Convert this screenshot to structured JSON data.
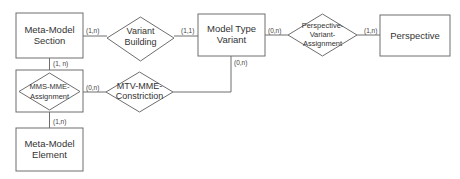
{
  "diagram": {
    "type": "entity-relationship",
    "colors": {
      "stroke": "#6e6e6e",
      "text": "#333333",
      "background": "#ffffff"
    },
    "entities": [
      {
        "id": "mms",
        "label_lines": [
          "Meta-Model",
          "Section"
        ]
      },
      {
        "id": "mtv",
        "label_lines": [
          "Model Type",
          "Variant"
        ]
      },
      {
        "id": "persp",
        "label_lines": [
          "Perspective"
        ]
      },
      {
        "id": "mme",
        "label_lines": [
          "Meta-Model",
          "Element"
        ]
      }
    ],
    "relationships": [
      {
        "id": "vb",
        "label_lines": [
          "Variant",
          "Building"
        ]
      },
      {
        "id": "pva",
        "label_lines": [
          "Perspective-",
          "Variant-",
          "Assignment"
        ]
      },
      {
        "id": "mmsmme",
        "label_lines": [
          "MMS-MME-",
          "Assignment"
        ]
      },
      {
        "id": "mtvmme",
        "label_lines": [
          "MTV-MME-",
          "Constriction"
        ]
      }
    ],
    "cardinalities": [
      {
        "edge": "mms-vb",
        "text": "(1,n)"
      },
      {
        "edge": "vb-mtv",
        "text": "(1,1)"
      },
      {
        "edge": "mtv-pva",
        "text": "(0,n)"
      },
      {
        "edge": "pva-persp",
        "text": "(1,n)"
      },
      {
        "edge": "mms-mmsmme",
        "text": "(1, n)"
      },
      {
        "edge": "mmsmme-mtvmme",
        "text": "(0,n)"
      },
      {
        "edge": "mtv-mtvmme",
        "text": "(0,n)"
      },
      {
        "edge": "mmsmme-mme",
        "text": "(1,n)"
      }
    ]
  }
}
